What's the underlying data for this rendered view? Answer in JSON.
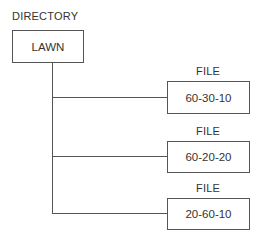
{
  "directory": {
    "heading": "DIRECTORY",
    "name": "LAWN"
  },
  "files": [
    {
      "heading": "FILE",
      "name": "60-30-10"
    },
    {
      "heading": "FILE",
      "name": "60-20-20"
    },
    {
      "heading": "FILE",
      "name": "20-60-10"
    }
  ]
}
